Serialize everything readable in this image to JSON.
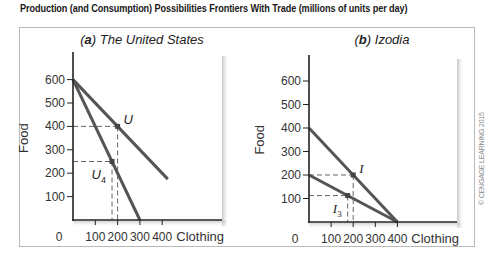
{
  "figure": {
    "title": "Production (and Consumption) Possibilities Frontiers With Trade (millions of units per day)",
    "credit": "© CENGAGE LEARNING 2015"
  },
  "style": {
    "line_color": "#555555",
    "axis_color": "#222222",
    "dash_color": "#666666",
    "shadow_color": "#cfcfcf"
  },
  "chart_data": [
    {
      "type": "line",
      "panel_letter": "a",
      "title": "The United States",
      "xlabel": "Clothing",
      "ylabel": "Food",
      "origin_label": "0",
      "xlim": [
        0,
        450
      ],
      "ylim": [
        0,
        650
      ],
      "xticks": [
        100,
        200,
        300,
        400
      ],
      "yticks": [
        100,
        200,
        300,
        400,
        500,
        600
      ],
      "grid": false,
      "series": [
        {
          "name": "Production possibilities frontier",
          "points": [
            [
              0,
              600
            ],
            [
              300,
              0
            ]
          ]
        },
        {
          "name": "Consumption possibilities with trade",
          "points": [
            [
              0,
              600
            ],
            [
              425,
              175
            ]
          ]
        }
      ],
      "annotations": [
        {
          "label": "U",
          "sub": "",
          "x": 200,
          "y": 400,
          "style": "sans"
        },
        {
          "label": "U",
          "sub": "4",
          "x": 175,
          "y": 250,
          "style": "sans"
        }
      ]
    },
    {
      "type": "line",
      "panel_letter": "b",
      "title": "Izodia",
      "xlabel": "Clothing",
      "ylabel": "Food",
      "origin_label": "0",
      "xlim": [
        0,
        450
      ],
      "ylim": [
        0,
        650
      ],
      "xticks": [
        100,
        200,
        300,
        400
      ],
      "yticks": [
        100,
        200,
        300,
        400,
        500,
        600
      ],
      "grid": false,
      "series": [
        {
          "name": "Production possibilities frontier",
          "points": [
            [
              0,
              200
            ],
            [
              400,
              0
            ]
          ]
        },
        {
          "name": "Consumption possibilities with trade",
          "points": [
            [
              0,
              400
            ],
            [
              400,
              0
            ]
          ]
        }
      ],
      "annotations": [
        {
          "label": "I",
          "sub": "",
          "x": 200,
          "y": 200,
          "style": "serif"
        },
        {
          "label": "I",
          "sub": "3",
          "x": 175,
          "y": 112.5,
          "style": "serif"
        }
      ]
    }
  ]
}
